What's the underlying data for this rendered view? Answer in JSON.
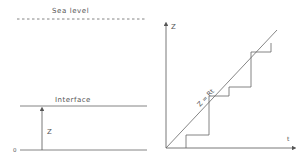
{
  "left_panel": {
    "sea_level_label": "Sea level",
    "interface_label": "Interface",
    "z_label": "Z",
    "origin_label": "0"
  },
  "right_panel": {
    "y_axis_label": "Z",
    "x_axis_label": "t",
    "line_label": "Z = Rt"
  },
  "colors": {
    "line": "#666666",
    "text": "#555555"
  }
}
